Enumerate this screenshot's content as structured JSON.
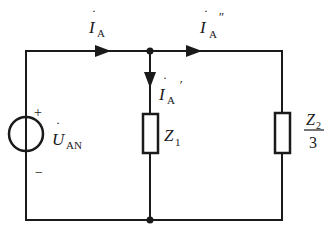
{
  "diagram": {
    "type": "circuit",
    "source": {
      "name": "U",
      "subscript": "AN",
      "dot": true,
      "plus": "+",
      "minus": "−"
    },
    "currents": {
      "total": {
        "name": "I",
        "subscript": "A",
        "dot": true,
        "prime": ""
      },
      "branch1": {
        "name": "I",
        "subscript": "A",
        "dot": true,
        "prime": "′"
      },
      "branch2": {
        "name": "I",
        "subscript": "A",
        "dot": true,
        "prime": "″"
      }
    },
    "impedances": {
      "z1": {
        "name": "Z",
        "subscript": "1"
      },
      "z2": {
        "numerator_name": "Z",
        "numerator_subscript": "2",
        "denominator": "3"
      }
    },
    "colors": {
      "wire": "#1a1a1a",
      "background": "#ffffff"
    }
  }
}
